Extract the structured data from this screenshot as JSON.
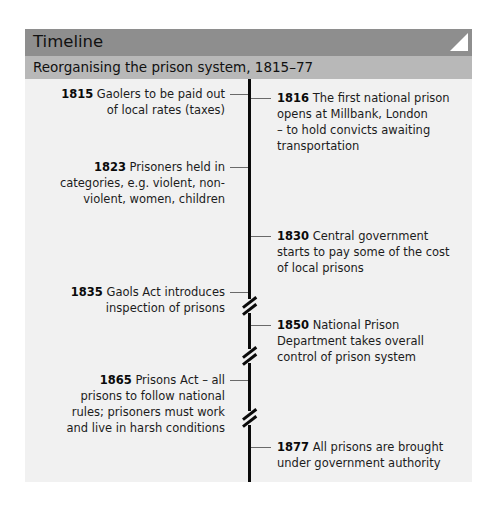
{
  "header": {
    "title": "Timeline",
    "corner_icon": "page-curl-icon"
  },
  "subheader": {
    "title": "Reorganising the prison system, 1815–77"
  },
  "events": [
    {
      "year": "1815",
      "side": "left",
      "lines": [
        "Gaolers to be paid out",
        "of local rates (taxes)"
      ]
    },
    {
      "year": "1816",
      "side": "right",
      "lines": [
        "The first national prison",
        "opens at Millbank, London",
        "– to hold convicts awaiting",
        "transportation"
      ]
    },
    {
      "year": "1823",
      "side": "left",
      "lines": [
        "Prisoners held in",
        "categories, e.g. violent, non-",
        "violent, women, children"
      ]
    },
    {
      "year": "1830",
      "side": "right",
      "lines": [
        "Central government",
        "starts to pay some of the cost",
        "of local prisons"
      ]
    },
    {
      "year": "1835",
      "side": "left",
      "lines": [
        "Gaols Act introduces",
        "inspection of prisons"
      ]
    },
    {
      "year": "1850",
      "side": "right",
      "lines": [
        "National Prison",
        "Department takes overall",
        "control of prison system"
      ]
    },
    {
      "year": "1865",
      "side": "left",
      "lines": [
        "Prisons Act – all",
        "prisons to follow national",
        "rules; prisoners must work",
        "and live in harsh conditions"
      ]
    },
    {
      "year": "1877",
      "side": "right",
      "lines": [
        "All prisons are brought",
        "under government authority"
      ]
    }
  ],
  "axis": {
    "breaks": 3,
    "start_year": "1815",
    "end_year": "1877"
  },
  "colors": {
    "header_bg": "#8e8e8e",
    "subheader_bg": "#b8b8b8",
    "body_bg": "#f1f1f1",
    "axis": "#0a0a0a"
  }
}
